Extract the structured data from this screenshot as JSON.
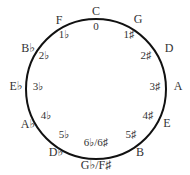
{
  "diagram": {
    "circle": {
      "cx": 96,
      "cy": 89,
      "r": 70,
      "stroke": "#111111",
      "stroke_width": 2
    },
    "keys": [
      {
        "label": "C",
        "x": 96,
        "y": 11
      },
      {
        "label": "G",
        "x": 138,
        "y": 19
      },
      {
        "label": "D",
        "x": 169,
        "y": 48
      },
      {
        "label": "A",
        "x": 178,
        "y": 86
      },
      {
        "label": "E",
        "x": 167,
        "y": 123
      },
      {
        "label": "B",
        "x": 140,
        "y": 152
      },
      {
        "label": "G♭/F♯",
        "x": 96,
        "y": 165
      },
      {
        "label": "D♭",
        "x": 56,
        "y": 152
      },
      {
        "label": "A♭",
        "x": 28,
        "y": 124
      },
      {
        "label": "E♭",
        "x": 16,
        "y": 86
      },
      {
        "label": "B♭",
        "x": 28,
        "y": 48
      },
      {
        "label": "F",
        "x": 59,
        "y": 20
      }
    ],
    "signatures": [
      {
        "label": "0",
        "x": 96,
        "y": 26
      },
      {
        "label": "1♯",
        "x": 129,
        "y": 34
      },
      {
        "label": "2♯",
        "x": 146,
        "y": 55
      },
      {
        "label": "3♯",
        "x": 155,
        "y": 86
      },
      {
        "label": "4♯",
        "x": 148,
        "y": 115
      },
      {
        "label": "5♯",
        "x": 131,
        "y": 134
      },
      {
        "label": "6♭/6♯",
        "x": 96,
        "y": 142
      },
      {
        "label": "5♭",
        "x": 64,
        "y": 134
      },
      {
        "label": "4♭",
        "x": 46,
        "y": 115
      },
      {
        "label": "3♭",
        "x": 38,
        "y": 86
      },
      {
        "label": "2♭",
        "x": 44,
        "y": 55
      },
      {
        "label": "1♭",
        "x": 64,
        "y": 34
      }
    ]
  }
}
